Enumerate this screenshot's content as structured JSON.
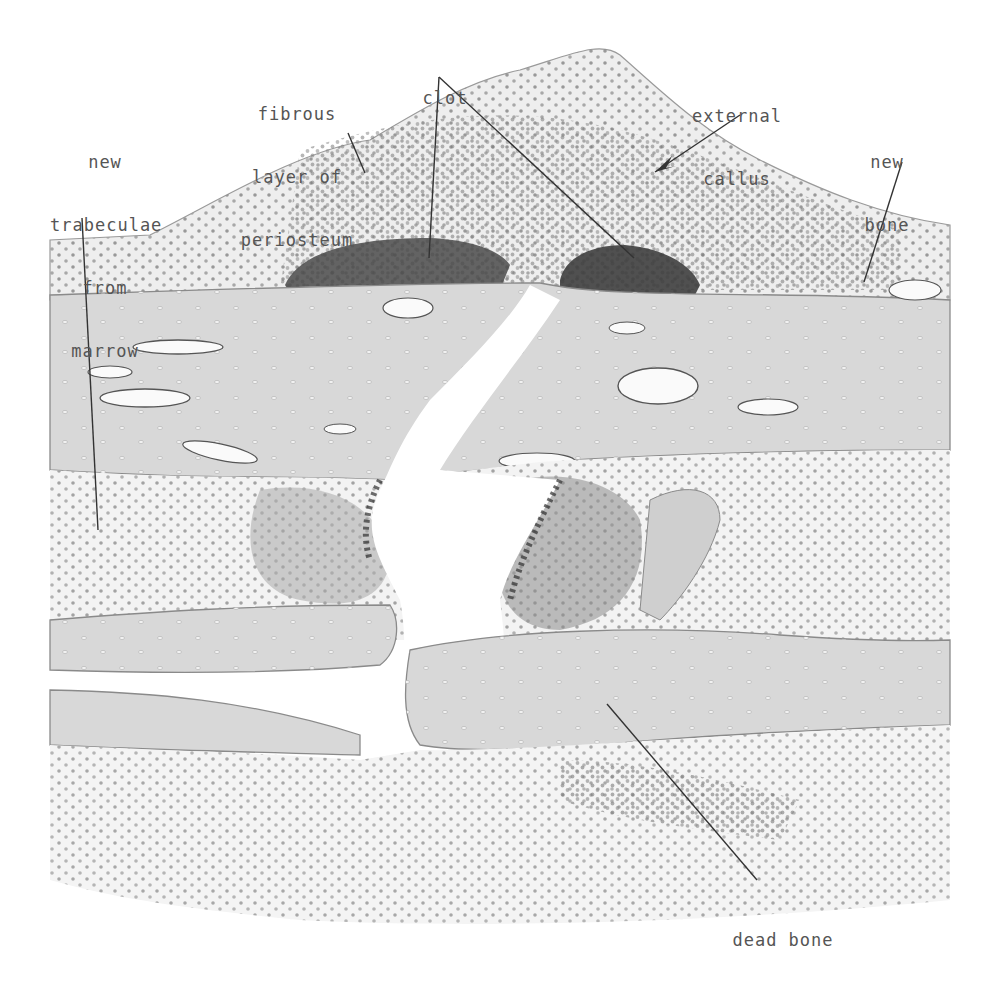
{
  "figure": {
    "colors": {
      "background": "#ffffff",
      "bone": "#d9d9d9",
      "bone_edge": "#8a8a8a",
      "marrow_cells": "#9a9a9a",
      "clot": "#3c3c3c",
      "fibrous": "#e8e8e8",
      "leader_line": "#333333",
      "label_text": "#555555"
    }
  },
  "labels": {
    "new_trabeculae": {
      "lines": [
        "new",
        "trabeculae",
        "from",
        "marrow"
      ]
    },
    "fibrous_layer": {
      "lines": [
        "fibrous",
        "layer of",
        "periosteum"
      ]
    },
    "clot": {
      "lines": [
        "clot"
      ]
    },
    "external_callus": {
      "lines": [
        "external",
        "callus"
      ]
    },
    "new_bone": {
      "lines": [
        "new",
        "bone"
      ]
    },
    "dead_bone": {
      "lines": [
        "dead bone"
      ]
    }
  }
}
